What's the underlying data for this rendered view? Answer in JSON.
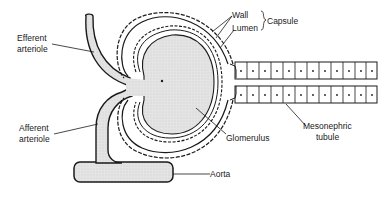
{
  "diagram": {
    "type": "anatomical",
    "labels": {
      "efferent": [
        "Efferent",
        "arteriole"
      ],
      "afferent": [
        "Afferent",
        "arteriole"
      ],
      "wall": "Wall",
      "lumen": "Lumen",
      "capsule": "Capsule",
      "glomerulus": "Glomerulus",
      "mesonephric": [
        "Mesonephric",
        "tubule"
      ],
      "aorta": "Aorta"
    },
    "colors": {
      "stroke": "#1a1a1a",
      "fill": "#e2e2e2",
      "background": "#ffffff"
    }
  }
}
